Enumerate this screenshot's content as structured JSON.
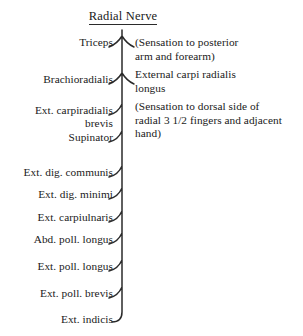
{
  "diagram": {
    "title": "Radial Nerve",
    "type": "nerve-branching-diagram",
    "trunk_x": 122,
    "trunk_top_y": 30,
    "trunk_bottom_y": 322,
    "line_color": "#2b2b2b",
    "background_color": "#ffffff",
    "text_color": "#1a1a1a"
  },
  "branches": [
    {
      "id": "triceps",
      "label": "Triceps",
      "label_right_x": 113,
      "label_y": 36,
      "connector": "fork",
      "connector_y": 41
    },
    {
      "id": "brachioradialis",
      "label": "Brachioradialis",
      "label_right_x": 113,
      "label_y": 73,
      "connector": "fork",
      "connector_y": 78
    },
    {
      "id": "ext-carpiradialis-brevis",
      "label": "Ext. carpiradialis\nbrevis",
      "label_right_x": 113,
      "label_y": 104,
      "connector": "hook",
      "connector_y": 110
    },
    {
      "id": "supinator",
      "label": "Supinator",
      "label_right_x": 113,
      "label_y": 131,
      "connector": "hook",
      "connector_y": 137
    },
    {
      "id": "ext-dig-communis",
      "label": "Ext. dig. communis",
      "label_right_x": 113,
      "label_y": 166,
      "connector": "hook",
      "connector_y": 172
    },
    {
      "id": "ext-dig-minimi",
      "label": "Ext. dig. minimi",
      "label_right_x": 113,
      "label_y": 188,
      "connector": "hook",
      "connector_y": 194
    },
    {
      "id": "ext-carpiulnaris",
      "label": "Ext. carpiulnaris",
      "label_right_x": 113,
      "label_y": 211,
      "connector": "hook",
      "connector_y": 217
    },
    {
      "id": "abd-poll-longus",
      "label": "Abd. poll. longus",
      "label_right_x": 113,
      "label_y": 233,
      "connector": "hook",
      "connector_y": 239
    },
    {
      "id": "ext-poll-longus",
      "label": "Ext. poll. longus",
      "label_right_x": 113,
      "label_y": 260,
      "connector": "hook",
      "connector_y": 266
    },
    {
      "id": "ext-poll-brevis",
      "label": "Ext. poll. brevis",
      "label_right_x": 113,
      "label_y": 287,
      "connector": "hook",
      "connector_y": 293
    },
    {
      "id": "ext-indicis",
      "label": "Ext. indicis",
      "label_right_x": 113,
      "label_y": 313,
      "connector": "terminal-curve",
      "connector_y": 319
    }
  ],
  "notes": [
    {
      "id": "sensation-posterior-arm",
      "lines": [
        "(Sensation to posterior",
        "arm and forearm)"
      ],
      "left_x": 135,
      "top_y": 36
    },
    {
      "id": "external-carpi-radialis-longus",
      "lines": [
        "External carpi radialis",
        "longus"
      ],
      "left_x": 135,
      "top_y": 68
    },
    {
      "id": "sensation-dorsal-hand",
      "lines": [
        "(Sensation to dorsal side of",
        "radial 3 1/2 fingers and adjacent",
        "hand)"
      ],
      "left_x": 135,
      "top_y": 100
    }
  ]
}
